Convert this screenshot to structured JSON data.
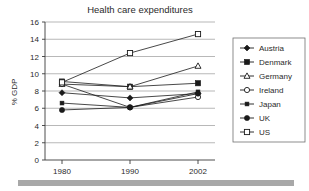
{
  "chart_data": {
    "type": "line",
    "title": "Health care expenditures",
    "xlabel": "",
    "ylabel": "% GDP",
    "categories": [
      "1980",
      "1990",
      "2002"
    ],
    "x": [
      1980,
      1990,
      2002
    ],
    "ylim": [
      0,
      16
    ],
    "yticks": [
      "0",
      "2",
      "4",
      "6",
      "8",
      "10",
      "12",
      "14",
      "16"
    ],
    "ytick_values": [
      0,
      2,
      4,
      6,
      8,
      10,
      12,
      14,
      16
    ],
    "grid": true,
    "legend_position": "right",
    "series": [
      {
        "name": "Austria",
        "marker": "filled-diamond",
        "values": [
          7.8,
          7.2,
          7.7
        ]
      },
      {
        "name": "Denmark",
        "marker": "filled-square",
        "values": [
          9.1,
          8.5,
          8.9
        ]
      },
      {
        "name": "Germany",
        "marker": "open-triangle",
        "values": [
          8.8,
          8.5,
          10.9
        ]
      },
      {
        "name": "Ireland",
        "marker": "open-circle",
        "values": [
          8.8,
          6.1,
          7.3
        ]
      },
      {
        "name": "Japan",
        "marker": "small-square",
        "values": [
          6.6,
          6.1,
          7.9
        ]
      },
      {
        "name": "UK",
        "marker": "filled-circle",
        "values": [
          5.8,
          6.1,
          7.7
        ]
      },
      {
        "name": "US",
        "marker": "open-square",
        "values": [
          9.0,
          12.4,
          14.6
        ]
      }
    ]
  },
  "legend": {
    "items": [
      {
        "label": "Austria"
      },
      {
        "label": "Denmark"
      },
      {
        "label": "Germany"
      },
      {
        "label": "Ireland"
      },
      {
        "label": "Japan"
      },
      {
        "label": "UK"
      },
      {
        "label": "US"
      }
    ]
  },
  "colors": {
    "line": "#1a1a1a",
    "grid": "#9a9a9a",
    "frame": "#555555",
    "text": "#2b2b2b",
    "background": "#ffffff",
    "bottom_bar": "#a8a8a8"
  }
}
